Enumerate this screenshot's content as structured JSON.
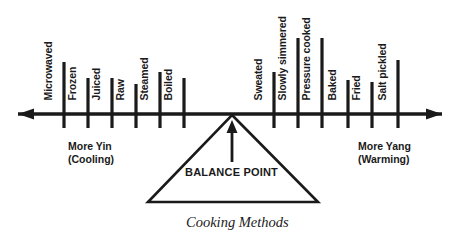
{
  "chart_data": {
    "type": "diagram",
    "title": "Cooking Methods",
    "subtitle": "",
    "axis": {
      "orientation": "horizontal",
      "double_headed": true,
      "left_end_label": "More Yin\n(Cooling)",
      "right_end_label": "More Yang\n(Warming)",
      "center_marker": "BALANCE POINT",
      "x_pixel_start": 18,
      "x_pixel_end": 442,
      "y_pixel": 114
    },
    "categories": [
      "Microwaved",
      "Frozen",
      "Juiced",
      "Raw",
      "Steamed",
      "Boiled",
      "Sweated",
      "Slowly simmered",
      "Pressure cooked",
      "Baked",
      "Fried",
      "Salt pickled"
    ],
    "values": [
      -6,
      -5,
      -4,
      -3,
      -2,
      -1,
      1,
      2,
      3,
      4,
      5,
      6
    ],
    "xlabel": "Cooking Methods",
    "ylabel": "",
    "grid": false,
    "legend": "none"
  },
  "axis_line": {
    "left_arrow_name": "left-arrow-head",
    "right_arrow_name": "right-arrow-head"
  },
  "ticks": [
    {
      "label": "Microwaved",
      "x": 64,
      "top": 62,
      "bottom": 128,
      "label_baseline_y": 100
    },
    {
      "label": "Frozen",
      "x": 88,
      "top": 78,
      "bottom": 128,
      "label_baseline_y": 100
    },
    {
      "label": "Juiced",
      "x": 112,
      "top": 78,
      "bottom": 128,
      "label_baseline_y": 100
    },
    {
      "label": "Raw",
      "x": 136,
      "top": 84,
      "bottom": 128,
      "label_baseline_y": 100
    },
    {
      "label": "Steamed",
      "x": 160,
      "top": 72,
      "bottom": 128,
      "label_baseline_y": 100
    },
    {
      "label": "Boiled",
      "x": 184,
      "top": 78,
      "bottom": 128,
      "label_baseline_y": 100
    },
    {
      "label": "Sweated",
      "x": 274,
      "top": 72,
      "bottom": 128,
      "label_baseline_y": 100
    },
    {
      "label": "Slowly simmered",
      "x": 298,
      "top": 38,
      "bottom": 128,
      "label_baseline_y": 100
    },
    {
      "label": "Pressure cooked",
      "x": 322,
      "top": 38,
      "bottom": 128,
      "label_baseline_y": 100
    },
    {
      "label": "Baked",
      "x": 348,
      "top": 80,
      "bottom": 128,
      "label_baseline_y": 100
    },
    {
      "label": "Fried",
      "x": 372,
      "top": 82,
      "bottom": 128,
      "label_baseline_y": 100
    },
    {
      "label": "Salt pickled",
      "x": 398,
      "top": 60,
      "bottom": 128,
      "label_baseline_y": 100
    }
  ],
  "notes": {
    "left": {
      "line1": "More Yin",
      "line2": "(Cooling)",
      "x": 68,
      "y": 140
    },
    "right": {
      "line1": "More Yang",
      "line2": "(Warming)",
      "x": 358,
      "y": 140
    }
  },
  "balance": {
    "label": "BALANCE POINT",
    "apex_x": 232,
    "apex_y": 115,
    "base_left_x": 148,
    "base_right_x": 318,
    "base_y": 202
  },
  "caption": {
    "text": "Cooking Methods",
    "x": 186,
    "y": 214
  },
  "colors": {
    "ink": "#1a1a1a",
    "background": "#ffffff"
  }
}
